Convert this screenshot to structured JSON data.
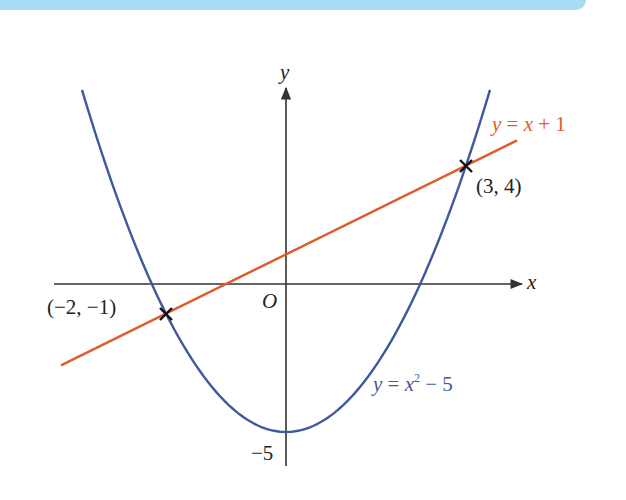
{
  "banner": {
    "color": "#a6dcf5"
  },
  "axes": {
    "x_label": "x",
    "y_label": "y",
    "origin_label": "O",
    "y_tick_label": "−5",
    "color": "#333333"
  },
  "curves": {
    "parabola": {
      "label_y": "y",
      "label_eq": " = ",
      "label_x": "x",
      "label_exp": "2",
      "label_rest": " − 5",
      "equation": "y = x² − 5",
      "color": "#3f5a9c"
    },
    "line": {
      "label_y": "y",
      "label_eq": " = ",
      "label_x": "x",
      "label_rest": " + 1",
      "equation": "y = x + 1",
      "color": "#e05a2b"
    }
  },
  "points": [
    {
      "label": "(3, 4)",
      "x": 3,
      "y": 4
    },
    {
      "label": "(−2, −1)",
      "x": -2,
      "y": -1
    }
  ],
  "chart_data": {
    "type": "line",
    "title": "",
    "xlabel": "x",
    "ylabel": "y",
    "xlim": [
      -3.4,
      3.9
    ],
    "ylim": [
      -6.1,
      7.7
    ],
    "grid": false,
    "series": [
      {
        "name": "y = x² − 5",
        "function": "x^2 - 5",
        "color": "#3f5a9c",
        "x_range": [
          -3.4,
          3.4
        ]
      },
      {
        "name": "y = x + 1",
        "function": "x + 1",
        "color": "#e05a2b",
        "x_range": [
          -3.75,
          3.85
        ]
      }
    ],
    "annotations": [
      {
        "text": "(3, 4)",
        "x": 3,
        "y": 4,
        "marker": "cross"
      },
      {
        "text": "(−2, −1)",
        "x": -2,
        "y": -1,
        "marker": "cross"
      },
      {
        "text": "O",
        "x": 0,
        "y": 0
      },
      {
        "text": "−5",
        "x": 0,
        "y": -5
      }
    ]
  }
}
